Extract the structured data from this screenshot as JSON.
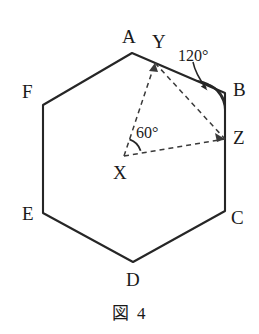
{
  "figure": {
    "caption": "図 4",
    "shape_name": "regular-hexagon",
    "stroke_color": "#262626",
    "dashed_color": "#3a3a3a",
    "background": "#ffffff",
    "hexagon": {
      "vertices": [
        {
          "label": "A",
          "x": 132,
          "y": 53,
          "label_x": 122,
          "label_y": 27
        },
        {
          "label": "B",
          "x": 225,
          "y": 93,
          "label_x": 233,
          "label_y": 80
        },
        {
          "label": "C",
          "x": 225,
          "y": 211,
          "label_x": 231,
          "label_y": 208
        },
        {
          "label": "D",
          "x": 133,
          "y": 262,
          "label_x": 126,
          "label_y": 270
        },
        {
          "label": "E",
          "x": 43,
          "y": 213,
          "label_x": 22,
          "label_y": 204
        },
        {
          "label": "F",
          "x": 43,
          "y": 105,
          "label_x": 22,
          "label_y": 82
        }
      ]
    },
    "inner_points": [
      {
        "label": "Y",
        "x": 155,
        "y": 63,
        "label_x": 152,
        "label_y": 32,
        "on_edge": "AB"
      },
      {
        "label": "Z",
        "x": 225,
        "y": 139,
        "label_x": 233,
        "label_y": 128,
        "on_edge": "BC"
      },
      {
        "label": "X",
        "x": 124,
        "y": 156,
        "label_x": 113,
        "label_y": 163,
        "on_edge": "center"
      }
    ],
    "dashed_segments": [
      {
        "from": "X",
        "to": "Y"
      },
      {
        "from": "Y",
        "to": "Z"
      },
      {
        "from": "X",
        "to": "Z"
      }
    ],
    "angles": [
      {
        "value": "60°",
        "at": "X",
        "label_x": 136,
        "label_y": 125,
        "marker": "arc"
      },
      {
        "value": "120°",
        "at": "B",
        "label_x": 178,
        "label_y": 48,
        "marker": "arc-with-leader-arrow"
      }
    ]
  }
}
